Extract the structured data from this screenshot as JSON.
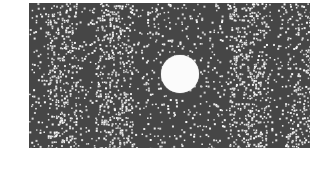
{
  "image": {
    "description": "Dark gray rectangle filled with scattered white random dots, denser in vertical bands, with a solid white circle slightly right of center",
    "background_color": "#ffffff",
    "panel": {
      "x": 29,
      "y": 3,
      "width": 281,
      "height": 145,
      "color": "#464646"
    },
    "circle": {
      "cx": 180,
      "cy": 74,
      "r": 19,
      "color": "#fbfbfb"
    },
    "dots": {
      "color": "#e6e6e6",
      "base_density": 0.028,
      "dense_bands": [
        {
          "x0": 18,
          "x1": 48,
          "density": 0.075
        },
        {
          "x0": 66,
          "x1": 104,
          "density": 0.075
        },
        {
          "x0": 200,
          "x1": 238,
          "density": 0.075
        },
        {
          "x0": 258,
          "x1": 281,
          "density": 0.07
        }
      ],
      "seed": 7
    }
  }
}
